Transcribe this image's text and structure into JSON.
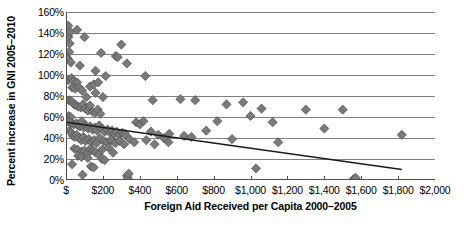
{
  "chart_data": {
    "type": "scatter",
    "title": "",
    "xlabel": "Foreign Aid Received per Capita 2000–2005",
    "ylabel": "Percent increase in GNI 2005–2010",
    "xlim": [
      0,
      2000
    ],
    "ylim": [
      0,
      160
    ],
    "xticks": [
      0,
      200,
      400,
      600,
      800,
      1000,
      1200,
      1400,
      1600,
      1800,
      2000
    ],
    "xticklabels": [
      "$",
      "$200",
      "$400",
      "$600",
      "$800",
      "$1,000",
      "$1,200",
      "$1,400",
      "$1,600",
      "$1,800",
      "$2,000"
    ],
    "yticks": [
      0,
      20,
      40,
      60,
      80,
      100,
      120,
      140,
      160
    ],
    "yticklabels": [
      "0%",
      "20%",
      "40%",
      "60%",
      "80%",
      "100%",
      "120%",
      "140%",
      "160%"
    ],
    "grid": "horizontal",
    "legend": "none",
    "marker": {
      "shape": "diamond",
      "size": 4.6,
      "fill": "#7a7a7a",
      "stroke": "#4d4d4d"
    },
    "series": [
      {
        "name": "Countries",
        "points": [
          [
            12,
            147
          ],
          [
            10,
            138
          ],
          [
            13,
            136
          ],
          [
            22,
            141
          ],
          [
            60,
            143
          ],
          [
            20,
            130
          ],
          [
            100,
            136
          ],
          [
            17,
            122
          ],
          [
            8,
            116
          ],
          [
            10,
            115
          ],
          [
            190,
            121
          ],
          [
            300,
            129
          ],
          [
            270,
            118
          ],
          [
            280,
            117
          ],
          [
            330,
            111
          ],
          [
            26,
            112
          ],
          [
            75,
            109
          ],
          [
            160,
            104
          ],
          [
            12,
            95
          ],
          [
            30,
            97
          ],
          [
            40,
            94
          ],
          [
            60,
            93
          ],
          [
            215,
            99
          ],
          [
            430,
            99
          ],
          [
            34,
            88
          ],
          [
            50,
            87
          ],
          [
            72,
            88
          ],
          [
            88,
            85
          ],
          [
            130,
            89
          ],
          [
            150,
            91
          ],
          [
            175,
            93
          ],
          [
            160,
            83
          ],
          [
            110,
            79
          ],
          [
            200,
            79
          ],
          [
            470,
            76
          ],
          [
            620,
            77
          ],
          [
            700,
            76
          ],
          [
            16,
            76
          ],
          [
            27,
            75
          ],
          [
            36,
            74
          ],
          [
            44,
            72
          ],
          [
            55,
            71
          ],
          [
            66,
            70
          ],
          [
            80,
            69
          ],
          [
            92,
            72
          ],
          [
            104,
            68
          ],
          [
            118,
            66
          ],
          [
            130,
            71
          ],
          [
            145,
            65
          ],
          [
            158,
            64
          ],
          [
            172,
            67
          ],
          [
            186,
            63
          ],
          [
            14,
            61
          ],
          [
            25,
            60
          ],
          [
            870,
            72
          ],
          [
            960,
            74
          ],
          [
            1060,
            68
          ],
          [
            1300,
            67
          ],
          [
            1500,
            67
          ],
          [
            10,
            56
          ],
          [
            20,
            55
          ],
          [
            33,
            54
          ],
          [
            42,
            53
          ],
          [
            55,
            54
          ],
          [
            64,
            52
          ],
          [
            76,
            51
          ],
          [
            86,
            56
          ],
          [
            96,
            50
          ],
          [
            108,
            52
          ],
          [
            120,
            49
          ],
          [
            132,
            51
          ],
          [
            144,
            48
          ],
          [
            156,
            50
          ],
          [
            168,
            47
          ],
          [
            180,
            52
          ],
          [
            195,
            49
          ],
          [
            210,
            46
          ],
          [
            225,
            48
          ],
          [
            238,
            45
          ],
          [
            250,
            47
          ],
          [
            262,
            44
          ],
          [
            275,
            46
          ],
          [
            290,
            43
          ],
          [
            305,
            45
          ],
          [
            320,
            44
          ],
          [
            380,
            55
          ],
          [
            400,
            53
          ],
          [
            420,
            56
          ],
          [
            460,
            46
          ],
          [
            500,
            43
          ],
          [
            530,
            40
          ],
          [
            560,
            44
          ],
          [
            640,
            42
          ],
          [
            760,
            47
          ],
          [
            820,
            56
          ],
          [
            1000,
            61
          ],
          [
            1120,
            55
          ],
          [
            1400,
            49
          ],
          [
            1820,
            43
          ],
          [
            18,
            47
          ],
          [
            28,
            45
          ],
          [
            38,
            42
          ],
          [
            48,
            41
          ],
          [
            58,
            43
          ],
          [
            70,
            40
          ],
          [
            82,
            38
          ],
          [
            94,
            41
          ],
          [
            106,
            37
          ],
          [
            124,
            39
          ],
          [
            138,
            36
          ],
          [
            152,
            38
          ],
          [
            166,
            35
          ],
          [
            184,
            40
          ],
          [
            205,
            37
          ],
          [
            222,
            36
          ],
          [
            245,
            38
          ],
          [
            268,
            35
          ],
          [
            292,
            37
          ],
          [
            315,
            34
          ],
          [
            345,
            39
          ],
          [
            370,
            36
          ],
          [
            435,
            38
          ],
          [
            480,
            34
          ],
          [
            555,
            36
          ],
          [
            680,
            41
          ],
          [
            900,
            39
          ],
          [
            1150,
            36
          ],
          [
            45,
            30
          ],
          [
            62,
            29
          ],
          [
            85,
            27
          ],
          [
            100,
            28
          ],
          [
            115,
            25
          ],
          [
            133,
            30
          ],
          [
            148,
            28
          ],
          [
            162,
            26
          ],
          [
            178,
            24
          ],
          [
            196,
            29
          ],
          [
            230,
            31
          ],
          [
            255,
            26
          ],
          [
            66,
            23
          ],
          [
            84,
            22
          ],
          [
            118,
            21
          ],
          [
            195,
            20
          ],
          [
            210,
            19
          ],
          [
            33,
            15
          ],
          [
            135,
            13
          ],
          [
            150,
            12
          ],
          [
            90,
            5
          ],
          [
            330,
            4
          ],
          [
            335,
            2
          ],
          [
            340,
            6
          ],
          [
            1030,
            11
          ],
          [
            1560,
            1
          ],
          [
            1570,
            2
          ]
        ]
      }
    ],
    "trendline": {
      "type": "linear",
      "x_start": 0,
      "y_start": 55,
      "x_end": 1820,
      "y_end": 10,
      "color": "#1a1a1a"
    },
    "colors": {
      "gridline": "#808080",
      "axis": "#4d4d4d",
      "text": "#000000",
      "marker_fill": "#7a7a7a",
      "trendline": "#1a1a1a"
    }
  }
}
